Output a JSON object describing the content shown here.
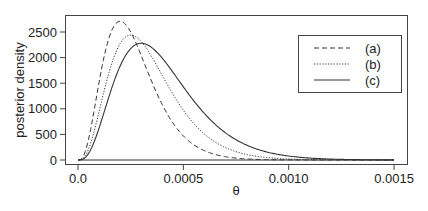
{
  "chart_data": {
    "type": "line",
    "title": "",
    "xlabel": "θ",
    "ylabel": "posterior density",
    "xlim": [
      -6e-05,
      0.00157
    ],
    "ylim": [
      -80,
      2830
    ],
    "xticks": [
      0.0,
      0.0005,
      0.001,
      0.0015
    ],
    "xtick_labels": [
      "0.0",
      "0.0005",
      "0.0010",
      "0.0015"
    ],
    "yticks": [
      0,
      500,
      1000,
      1500,
      2000,
      2500
    ],
    "ytick_labels": [
      "0",
      "500",
      "1000",
      "1500",
      "2000",
      "2500"
    ],
    "grid": false,
    "legend_position": "upper right",
    "series": [
      {
        "name": "(a)",
        "style": "dashed",
        "mode": 0.0002,
        "peak": 2710,
        "shape": 4
      },
      {
        "name": "(b)",
        "style": "dotted",
        "mode": 0.00025,
        "peak": 2440,
        "shape": 4
      },
      {
        "name": "(c)",
        "style": "solid",
        "mode": 0.0003,
        "peak": 2280,
        "shape": 4
      }
    ],
    "x_range_plotted": [
      0.0,
      0.0015
    ]
  }
}
